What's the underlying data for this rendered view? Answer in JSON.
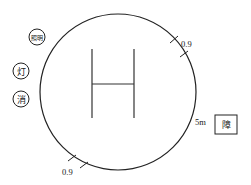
{
  "diagram": {
    "type": "heliport-layout",
    "colors": {
      "stroke": "#222222",
      "background": "#ffffff"
    },
    "pad": {
      "shape": "circle",
      "center_symbol": "H"
    },
    "markers": [
      {
        "id": "lighting",
        "label": "照明",
        "shape": "circle"
      },
      {
        "id": "lamp",
        "label": "灯",
        "shape": "circle"
      },
      {
        "id": "fire",
        "label": "消",
        "shape": "circle"
      }
    ],
    "obstacle": {
      "label": "障",
      "shape": "square"
    },
    "dimensions": {
      "top_right_gap": "0.9",
      "bottom_left_gap": "0.9",
      "obstacle_distance": "5m"
    }
  }
}
